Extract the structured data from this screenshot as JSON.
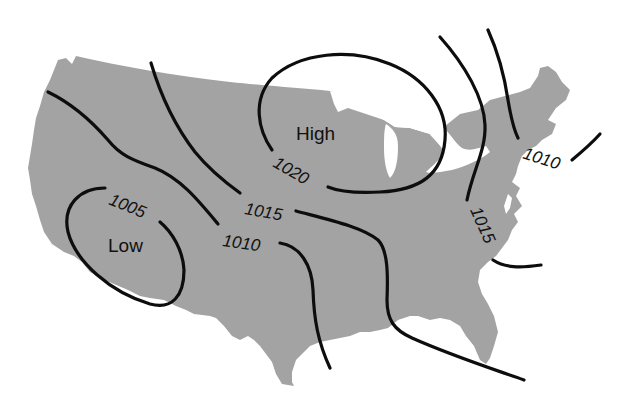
{
  "figure": {
    "background_color": "#ffffff",
    "land_color": "#a3a3a3",
    "line_color": "#0d0d0d",
    "text_color": "#111111"
  },
  "pressure_systems": [
    {
      "id": "high",
      "label": "High",
      "x": 296,
      "y": 140
    },
    {
      "id": "low",
      "label": "Low",
      "x": 108,
      "y": 252
    }
  ],
  "isobar_labels": [
    {
      "id": "label-1005",
      "value": "1005",
      "x": 108,
      "y": 204,
      "rotate": 22
    },
    {
      "id": "label-1010-west",
      "value": "1010",
      "x": 222,
      "y": 246,
      "rotate": 8
    },
    {
      "id": "label-1015-central",
      "value": "1015",
      "x": 244,
      "y": 214,
      "rotate": 10
    },
    {
      "id": "label-1020",
      "value": "1020",
      "x": 272,
      "y": 166,
      "rotate": 30
    },
    {
      "id": "label-1015-east",
      "value": "1015",
      "x": 470,
      "y": 210,
      "rotate": 66
    },
    {
      "id": "label-1010-east",
      "value": "1010",
      "x": 522,
      "y": 158,
      "rotate": 18
    }
  ],
  "isobars": [
    {
      "id": "isobar-1005-low",
      "value": 1005,
      "closed_around": "Low",
      "path": "M 105 188 C 80 188, 62 205, 68 232 C 76 262, 110 292, 150 304 C 172 310, 184 296, 184 270 C 183 250, 172 232, 160 222"
    },
    {
      "id": "isobar-1010-west",
      "value": 1010,
      "path": "M 48 92 C 75 105, 95 125, 108 140 C 120 155, 132 160, 155 168 C 180 178, 198 200, 218 224"
    },
    {
      "id": "isobar-1010-west-south",
      "value": 1010,
      "path": "M 280 243 C 300 246, 312 265, 313 290 C 314 320, 318 342, 330 368"
    },
    {
      "id": "isobar-1015-central-west",
      "value": 1015,
      "path": "M 151 63 C 162 100, 178 130, 195 152 C 208 168, 222 180, 240 193"
    },
    {
      "id": "isobar-1015-central-east",
      "value": 1015,
      "path": "M 296 211 C 330 220, 362 227, 378 240 C 388 250, 388 275, 387 300 C 387 320, 394 330, 412 338 C 450 355, 490 368, 524 380"
    },
    {
      "id": "isobar-1020-high",
      "value": 1020,
      "closed_around": "High",
      "path": "M 272 150 C 258 130, 252 100, 272 78 C 300 52, 350 48, 390 64 C 425 78, 448 108, 445 140 C 442 175, 420 190, 380 192 C 360 193, 340 192, 328 187"
    },
    {
      "id": "isobar-1015-east",
      "value": 1015,
      "path": "M 440 37 C 465 65, 484 98, 485 125 C 486 150, 473 170, 467 200"
    },
    {
      "id": "isobar-1015-east-south",
      "value": 1015,
      "path": "M 493 260 C 505 268, 520 268, 541 265"
    },
    {
      "id": "isobar-1010-east",
      "value": 1010,
      "path": "M 488 30 C 498 52, 505 80, 508 100 C 511 118, 514 130, 518 138"
    },
    {
      "id": "isobar-1010-east-offshore",
      "value": 1010,
      "path": "M 572 160 C 584 150, 592 143, 600 134"
    }
  ]
}
